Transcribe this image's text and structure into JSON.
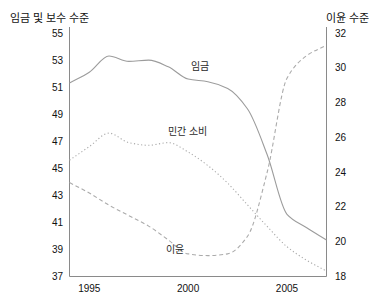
{
  "chart_data": {
    "type": "line",
    "title": "",
    "left_axis": {
      "label": "임금 및 보수 수준",
      "min": 37,
      "max": 55,
      "ticks": [
        55,
        53,
        51,
        49,
        47,
        45,
        43,
        41,
        39,
        37
      ]
    },
    "right_axis": {
      "label": "이윤 수준",
      "min": 18,
      "max": 32,
      "ticks": [
        32,
        30,
        28,
        26,
        24,
        22,
        20,
        18
      ]
    },
    "x_axis": {
      "min": 1994,
      "max": 2007,
      "tick_years": [
        1995,
        2000,
        2005
      ],
      "tick_labels": [
        "1995",
        "2000",
        "2005"
      ]
    },
    "years": [
      1994,
      1995,
      1996,
      1997,
      1998,
      1999,
      2000,
      2001,
      2002,
      2003,
      2004,
      2005,
      2006,
      2007
    ],
    "series": [
      {
        "id": "wage",
        "name": "임금",
        "axis": "left",
        "style": "solid",
        "values": [
          51.3,
          52.1,
          53.3,
          52.9,
          53.0,
          52.5,
          51.6,
          51.4,
          50.9,
          49.4,
          46.0,
          41.6,
          40.6,
          39.7
        ],
        "label_pos": {
          "x": 191,
          "y": 70
        }
      },
      {
        "id": "private-consumption",
        "name": "민간 소비",
        "axis": "left",
        "style": "dotted",
        "values": [
          45.6,
          46.6,
          47.6,
          46.9,
          46.7,
          46.9,
          46.2,
          45.2,
          43.9,
          42.3,
          40.7,
          39.2,
          38.2,
          37.4
        ],
        "label_pos": {
          "x": 168,
          "y": 135
        }
      },
      {
        "id": "profit",
        "name": "이윤",
        "axis": "right",
        "style": "dashed",
        "values": [
          23.4,
          22.8,
          22.1,
          21.5,
          20.9,
          20.1,
          19.3,
          19.2,
          19.3,
          20.3,
          24.0,
          29.4,
          30.7,
          31.3
        ],
        "label_pos": {
          "x": 166,
          "y": 253
        }
      }
    ],
    "legend_position": "inline-labels",
    "grid": false,
    "colors": {
      "solid_line": "#9c9c9c",
      "dotted_line": "#ababab",
      "dashed_line": "#ababab",
      "axis": "#8a8a8a",
      "text": "#111111",
      "background": "#ffffff"
    }
  }
}
